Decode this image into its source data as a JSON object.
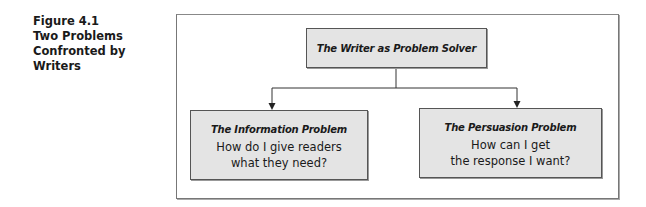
{
  "caption": {
    "lines": [
      "Figure 4.1",
      "Two Problems",
      "Confronted by",
      "Writers"
    ]
  },
  "diagram": {
    "root": {
      "title": "The Writer as Problem Solver"
    },
    "children": [
      {
        "title": "The Information Problem",
        "body_lines": [
          "How do I give readers",
          "what they need?"
        ]
      },
      {
        "title": "The Persuasion Problem",
        "body_lines": [
          "How can I get",
          "the response I want?"
        ]
      }
    ],
    "colors": {
      "box_fill": "#e4e4e4",
      "border": "#555555",
      "line": "#333333"
    }
  }
}
